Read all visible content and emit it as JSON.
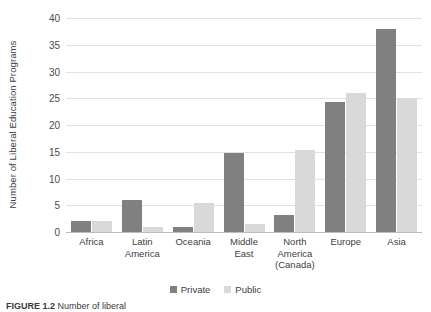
{
  "chart_data": {
    "type": "bar",
    "title": "",
    "xlabel": "",
    "ylabel": "Number of Liberal Education Programs",
    "ylim": [
      0,
      40
    ],
    "ytick_step": 5,
    "yticks": [
      40,
      35,
      30,
      25,
      20,
      15,
      10,
      5,
      0
    ],
    "grid": true,
    "legend_position": "bottom",
    "categories": [
      "Africa",
      "Latin America",
      "Oceania",
      "Middle East",
      "North America (Canada)",
      "Europe",
      "Asia"
    ],
    "category_lines": [
      [
        "Africa"
      ],
      [
        "Latin",
        "America"
      ],
      [
        "Oceania"
      ],
      [
        "Middle East"
      ],
      [
        "North",
        "America",
        "(Canada)"
      ],
      [
        "Europe"
      ],
      [
        "Asia"
      ]
    ],
    "series": [
      {
        "name": "Private",
        "color": "#808080",
        "values": [
          2.0,
          6.0,
          1.0,
          14.7,
          3.2,
          24.3,
          38.0
        ]
      },
      {
        "name": "Public",
        "color": "#d9d9d9",
        "values": [
          2.0,
          1.0,
          5.5,
          1.5,
          15.3,
          26.0,
          25.0
        ]
      }
    ]
  },
  "legend": {
    "items": [
      {
        "label": "Private",
        "color": "#808080"
      },
      {
        "label": "Public",
        "color": "#d9d9d9"
      }
    ]
  },
  "caption": {
    "label": "FIGURE 1.2",
    "text": "Number of liberal"
  },
  "colors": {
    "private": "#808080",
    "public": "#d9d9d9",
    "gridline": "#e2e2e2",
    "axis": "#bdbdbd",
    "text": "#404040"
  }
}
